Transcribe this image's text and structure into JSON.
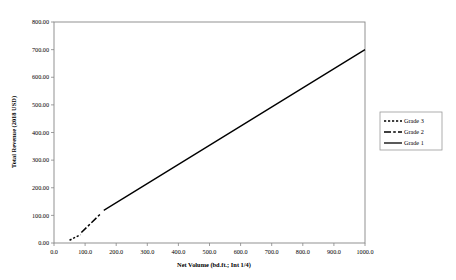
{
  "chart_data": {
    "type": "line",
    "title": "",
    "xlabel": "Net Volume (bd.ft.; Int 1/4)",
    "ylabel": "Total Revenue (2018 USD)",
    "xlim": [
      0,
      1000
    ],
    "ylim": [
      0,
      800
    ],
    "grid": false,
    "legend_position": "right",
    "x_ticks": [
      "0.0",
      "100.0",
      "200.0",
      "300.0",
      "400.0",
      "500.0",
      "600.0",
      "700.0",
      "800.0",
      "900.0",
      "1000.0"
    ],
    "x_tick_values": [
      0,
      100,
      200,
      300,
      400,
      500,
      600,
      700,
      800,
      900,
      1000
    ],
    "y_ticks": [
      "0.00",
      "100.00",
      "200.00",
      "300.00",
      "400.00",
      "500.00",
      "600.00",
      "700.00",
      "800.00"
    ],
    "y_tick_values": [
      0,
      100,
      200,
      300,
      400,
      500,
      600,
      700,
      800
    ],
    "series": [
      {
        "name": "Grade 3",
        "style": "dotted",
        "dash": "2.2,1.8",
        "width": 1.5,
        "color": "#000000",
        "x": [
          50,
          85
        ],
        "y": [
          10,
          30
        ]
      },
      {
        "name": "Grade 2",
        "style": "dash-dot",
        "dash": "7,2.2,2.6,2.2",
        "width": 1.5,
        "color": "#000000",
        "x": [
          88,
          152
        ],
        "y": [
          38,
          108
        ]
      },
      {
        "name": "Grade 1",
        "style": "solid",
        "dash": "none",
        "width": 1.3,
        "color": "#000000",
        "x": [
          160,
          1000
        ],
        "y": [
          118,
          700
        ]
      }
    ]
  },
  "legend": {
    "entries": [
      {
        "label": "Grade 3"
      },
      {
        "label": "Grade 2"
      },
      {
        "label": "Grade 1"
      }
    ]
  }
}
